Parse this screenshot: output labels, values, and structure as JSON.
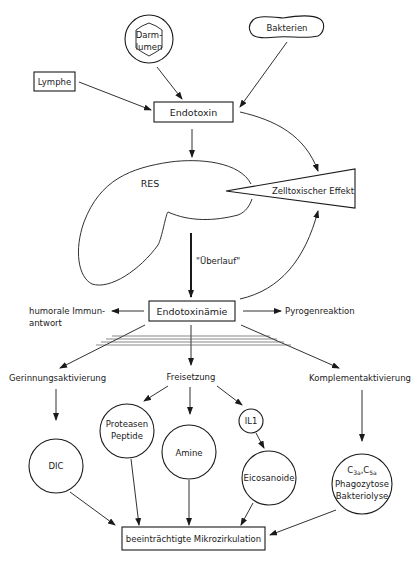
{
  "diagram": {
    "nodes": {
      "darmlumen": {
        "line1": "Darm-",
        "line2": "lumen"
      },
      "bakterien": "Bakterien",
      "lymphe": "Lymphe",
      "endotoxin": "Endotoxin",
      "res": "RES",
      "zelltoxisch": "Zelltoxischer Effekt",
      "ueberlauf": "\"Überlauf\"",
      "endotoxinaemie": "Endotoxinämie",
      "humorale": {
        "line1": "humorale Immun-",
        "line2": "antwort"
      },
      "pyrogen": "Pyrogenreaktion",
      "gerinnung": "Gerinnungsaktivierung",
      "freisetzung": "Freisetzung",
      "komplement": "Komplementaktivierung",
      "dic": "DIC",
      "proteasen": {
        "line1": "Proteasen",
        "line2": "Peptide"
      },
      "amine": "Amine",
      "il1": "IL1",
      "eicosanoide": "Eicosanoide",
      "complement_products": {
        "c3": "C",
        "c3sub": "3a",
        "sep": ",",
        "c5": "C",
        "c5sub": "5a",
        "line2": "Phagozytose",
        "line3": "Bakteriolyse"
      },
      "mikrozirkulation": "beeinträchtigte Mikrozirkulation"
    },
    "edges": [
      [
        "Darmlumen",
        "Endotoxin"
      ],
      [
        "Bakterien",
        "Endotoxin"
      ],
      [
        "Lymphe",
        "Endotoxin"
      ],
      [
        "Endotoxin",
        "RES"
      ],
      [
        "Endotoxin",
        "Zelltoxischer Effekt"
      ],
      [
        "RES",
        "Endotoxinämie"
      ],
      [
        "Endotoxinämie",
        "Zelltoxischer Effekt"
      ],
      [
        "Endotoxinämie",
        "humorale Immunantwort"
      ],
      [
        "Endotoxinämie",
        "Pyrogenreaktion"
      ],
      [
        "Endotoxinämie",
        "Gerinnungsaktivierung"
      ],
      [
        "Endotoxinämie",
        "Freisetzung"
      ],
      [
        "Endotoxinämie",
        "Komplementaktivierung"
      ],
      [
        "Gerinnungsaktivierung",
        "DIC"
      ],
      [
        "Freisetzung",
        "Proteasen Peptide"
      ],
      [
        "Freisetzung",
        "Amine"
      ],
      [
        "Freisetzung",
        "IL1"
      ],
      [
        "IL1",
        "Eicosanoide"
      ],
      [
        "Komplementaktivierung",
        "C3a,C5a Phagozytose Bakteriolyse"
      ],
      [
        "DIC",
        "beeinträchtigte Mikrozirkulation"
      ],
      [
        "Proteasen Peptide",
        "beeinträchtigte Mikrozirkulation"
      ],
      [
        "Amine",
        "beeinträchtigte Mikrozirkulation"
      ],
      [
        "Eicosanoide",
        "beeinträchtigte Mikrozirkulation"
      ],
      [
        "C3a,C5a Phagozytose Bakteriolyse",
        "beeinträchtigte Mikrozirkulation"
      ]
    ]
  }
}
